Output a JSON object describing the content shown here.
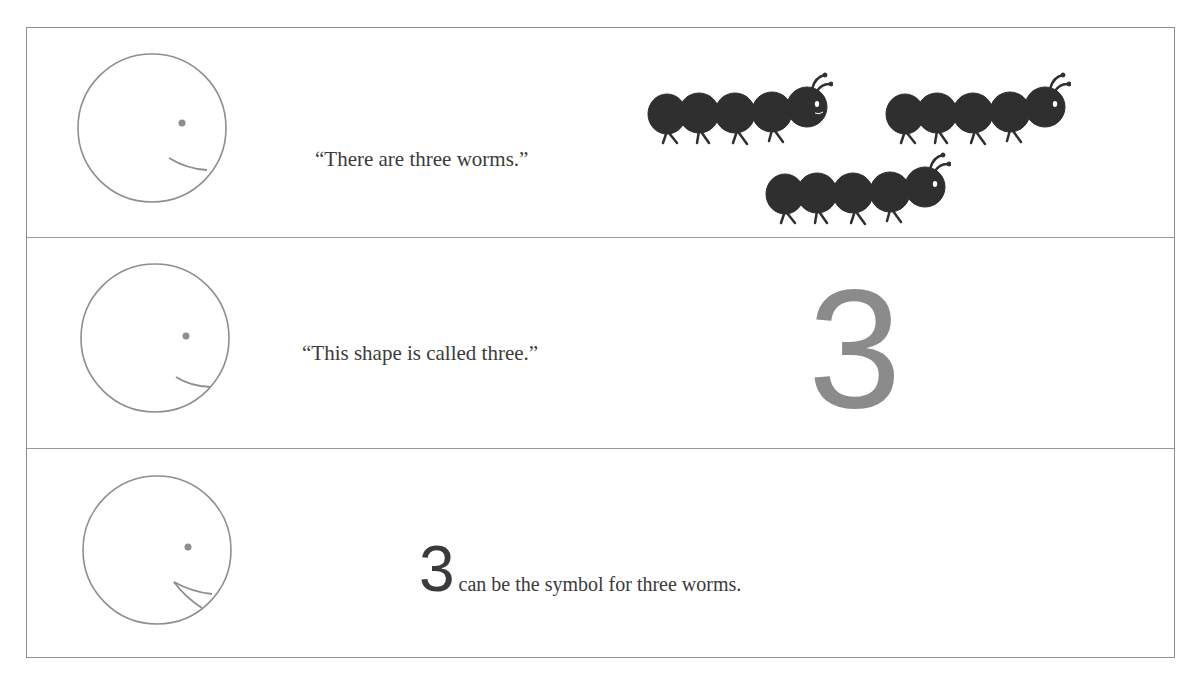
{
  "page": {
    "rows": [
      {
        "face": "smiling-face-closed-mouth",
        "caption": "“There are three worms.”",
        "illustration": {
          "type": "worms",
          "count": 3,
          "color": "#2f2f2f"
        }
      },
      {
        "face": "smiling-face-closed-mouth",
        "caption": "“This shape is called three.”",
        "illustration": {
          "type": "numeral",
          "value": "3",
          "color": "#8b8b8b"
        }
      },
      {
        "face": "smiling-face-open-mouth",
        "numeral": "3",
        "caption": "can be the symbol for three worms."
      }
    ]
  }
}
